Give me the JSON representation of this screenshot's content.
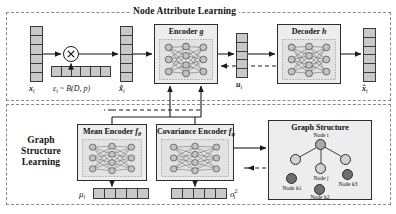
{
  "figure": {
    "kind": "architecture-diagram",
    "panels": {
      "top": {
        "title": "Node Attribute Learning"
      },
      "bottom": {
        "title": "Graph\nStructure\nLearning",
        "title_lines": [
          "Graph",
          "Structure",
          "Learning"
        ]
      }
    }
  },
  "nodes": {
    "input_vector_label": "x",
    "input_vector_sub": "i",
    "mask_label_prefix": "ε",
    "mask_label_sub": "i",
    "mask_label_rest": "~ B(D, p)",
    "masked_vector_label": "x̃",
    "masked_vector_sub": "i",
    "latent_vector_label": "u",
    "latent_vector_sub": "i",
    "output_vector_label": "x̂",
    "output_vector_sub": "i",
    "mu_label": "μ",
    "mu_sub": "i",
    "sigma_label": "σ",
    "sigma_sup": "2",
    "sigma_sub": "i"
  },
  "modules": {
    "encoder": {
      "name": "Encoder",
      "symbol": "g"
    },
    "decoder": {
      "name": "Decoder",
      "symbol": "h"
    },
    "mean_encoder": {
      "name": "Mean Encoder",
      "symbol": "f",
      "symbol_sub": "θ"
    },
    "covariance_encoder": {
      "name": "Covariance Encoder",
      "symbol": "f",
      "symbol_sub": "φ"
    }
  },
  "graph_structure": {
    "title": "Graph Structure",
    "nodes": [
      {
        "id": "i",
        "label": "Node i",
        "shade": "mid"
      },
      {
        "id": "l",
        "label": "",
        "shade": "light"
      },
      {
        "id": "r",
        "label": "",
        "shade": "light"
      },
      {
        "id": "j",
        "label": "Node j",
        "shade": "light"
      },
      {
        "id": "k1",
        "label": "Node k1",
        "shade": "dark"
      },
      {
        "id": "k2",
        "label": "Node k2",
        "shade": "dark"
      },
      {
        "id": "k3",
        "label": "Node k3",
        "shade": "dark"
      }
    ]
  },
  "operators": {
    "elementwise_product": "✕"
  },
  "colors": {
    "cell_fill": "#c9c9c9",
    "box_fill": "#ededed",
    "stroke": "#2e2e2e",
    "dashed_border": "#8a8a8a",
    "node_light": "#d2d2d2",
    "node_mid": "#a9a9a9",
    "node_dark": "#6e6e6e"
  }
}
